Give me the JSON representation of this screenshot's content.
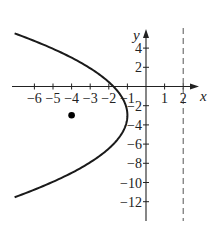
{
  "chart_data": {
    "type": "line",
    "title": "",
    "xlabel": "x",
    "ylabel": "y",
    "xlim": [
      -7.1,
      2.8
    ],
    "ylim": [
      -14,
      6
    ],
    "grid": false,
    "x_ticks": [
      -6,
      -5,
      -4,
      -3,
      -2,
      -1,
      1,
      2
    ],
    "x_tick_labels": [
      "−6",
      "−5",
      "−4",
      "−3",
      "−2",
      "−1",
      "1",
      "2"
    ],
    "y_ticks": [
      4,
      2,
      -2,
      -4,
      -6,
      -8,
      -10,
      -12
    ],
    "y_tick_labels": [
      "4",
      "2",
      "−2",
      "−4",
      "−6",
      "−8",
      "−10",
      "−12"
    ],
    "series": [
      {
        "name": "parabola",
        "equation": "(y+3)^2 = -12(x+1)",
        "style": "solid",
        "color": "#1a1a1a",
        "vertex": [
          -1,
          -3
        ],
        "opens": "left",
        "x": [
          -7.07,
          -6,
          -5,
          -4,
          -3,
          -2,
          -1,
          -2,
          -3,
          -4,
          -5,
          -6,
          -7.07
        ],
        "y": [
          5.53,
          4.75,
          3.93,
          3.0,
          1.9,
          0.46,
          -3,
          -6.46,
          -7.9,
          -9.0,
          -9.93,
          -10.75,
          -11.53
        ]
      },
      {
        "name": "directrix",
        "equation": "x = 2",
        "style": "dashed",
        "color": "#555555",
        "x": [
          2,
          2
        ],
        "y": [
          6,
          -14
        ]
      }
    ],
    "points": [
      {
        "name": "focus",
        "x": -4,
        "y": -3,
        "color": "#000000"
      }
    ],
    "legend": null
  },
  "labels": {
    "x_axis": "x",
    "y_axis": "y"
  }
}
